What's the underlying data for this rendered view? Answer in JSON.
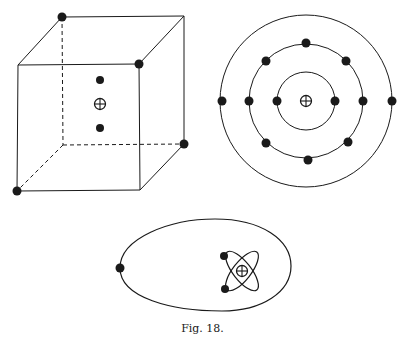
{
  "figure": {
    "caption": "Fig. 18.",
    "ink_color": "#1a1a1a",
    "background": "#ffffff",
    "panels": [
      {
        "id": "cube-atom",
        "description": "Cubic atom model: electrons at alternating cube corners, nucleus with two inner electrons at center",
        "cube": {
          "back": {
            "tl": [
              62,
              17
            ],
            "tr": [
              184,
              16
            ],
            "br": [
              184,
              144
            ],
            "bl": [
              63,
              145
            ]
          },
          "front": {
            "tl": [
              18,
              65
            ],
            "tr": [
              139,
              64
            ],
            "br": [
              140,
              190
            ],
            "bl": [
              17,
              191
            ]
          },
          "dashed_edges": [
            [
              "back.tl",
              "back.bl"
            ],
            [
              "back.bl",
              "back.br"
            ],
            [
              "back.bl",
              "front.bl"
            ]
          ]
        },
        "corner_electrons": [
          [
            62,
            17
          ],
          [
            139,
            64
          ],
          [
            184,
            144
          ],
          [
            17,
            191
          ]
        ],
        "inner_electrons": [
          [
            100,
            80
          ],
          [
            100,
            128
          ]
        ],
        "nucleus": [
          100,
          104
        ]
      },
      {
        "id": "ring-atom",
        "description": "Concentric ring atom model with electrons on three circular shells",
        "center": [
          306,
          101
        ],
        "rings": [
          {
            "radius": 29,
            "electron_angles": [
              0,
              180
            ]
          },
          {
            "radius": 57,
            "electron_angles": [
              0,
              45,
              90,
              135,
              180,
              225,
              270,
              315
            ]
          },
          {
            "radius": 86,
            "electron_angles": [
              0,
              180
            ]
          }
        ],
        "nucleus": [
          306,
          101
        ]
      },
      {
        "id": "elliptical-orbit-atom",
        "description": "Outer electron on large elliptical orbit around a core with two inner electrons on crossed small orbits",
        "outer_orbit": {
          "left": [
            120,
            268
          ],
          "right": [
            291,
            268
          ],
          "top": 219,
          "bottom": 310
        },
        "outer_electron": [
          120,
          268
        ],
        "core_center": [
          242,
          271
        ],
        "inner_orbits": [
          {
            "rx": 22,
            "ry": 9,
            "rotate": 55
          },
          {
            "rx": 22,
            "ry": 9,
            "rotate": -55
          }
        ],
        "inner_electrons": [
          [
            224,
            256
          ],
          [
            225,
            289
          ]
        ],
        "nucleus": [
          242,
          271
        ]
      }
    ]
  }
}
